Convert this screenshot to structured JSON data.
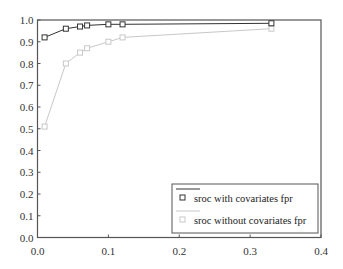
{
  "chart_data": {
    "type": "line",
    "title": "",
    "xlabel": "",
    "ylabel": "",
    "xlim": [
      0.0,
      0.4
    ],
    "ylim": [
      0.0,
      1.0
    ],
    "grid": false,
    "legend_position": "lower right",
    "x_ticks": [
      "0.0",
      "0.1",
      "0.2",
      "0.3",
      "0.4"
    ],
    "y_ticks": [
      "0.0",
      "0.1",
      "0.2",
      "0.3",
      "0.4",
      "0.5",
      "0.6",
      "0.7",
      "0.8",
      "0.9",
      "1.0"
    ],
    "series": [
      {
        "name": "sroc with covariates fpr",
        "color": "#333333",
        "marker": "square",
        "x": [
          0.01,
          0.04,
          0.06,
          0.07,
          0.1,
          0.12,
          0.33
        ],
        "values": [
          0.92,
          0.96,
          0.97,
          0.975,
          0.98,
          0.98,
          0.985
        ]
      },
      {
        "name": "sroc without covariates fpr",
        "color": "#c8c8c8",
        "marker": "square",
        "x": [
          0.01,
          0.04,
          0.06,
          0.07,
          0.1,
          0.12,
          0.33
        ],
        "values": [
          0.51,
          0.8,
          0.85,
          0.87,
          0.9,
          0.92,
          0.96
        ]
      }
    ]
  }
}
